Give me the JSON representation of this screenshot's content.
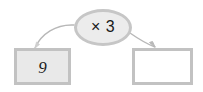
{
  "diagram": {
    "type": "function-machine",
    "background_color": "#ffffff"
  },
  "input_box": {
    "value": "9",
    "fill_color": "#e9e9e9",
    "border_color": "#c2c2c2"
  },
  "operation": {
    "label": "× 3",
    "operator": "×",
    "operand": "3",
    "fill_color": "#ececec",
    "border_color": "#c6c6c6"
  },
  "output_box": {
    "value": "",
    "fill_color": "#ffffff",
    "border_color": "#c2c2c2"
  },
  "arrows": [
    {
      "name": "input-to-operation",
      "from": "input_box",
      "to": "operation",
      "color": "#b8b8b8"
    },
    {
      "name": "operation-to-output",
      "from": "operation",
      "to": "output_box",
      "color": "#b8b8b8"
    }
  ]
}
